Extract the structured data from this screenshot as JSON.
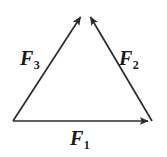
{
  "figure": {
    "name": "force-triangle-diagram",
    "background_color": "#ffffff",
    "stroke_color": "#2b2b2b",
    "stroke_width": 1.6
  },
  "vectors": [
    {
      "id": "f1",
      "label_base": "F",
      "label_sub": "1",
      "direction": "right",
      "from": [
        13,
        121
      ],
      "to": [
        152,
        121
      ],
      "arrowhead_at": "to"
    },
    {
      "id": "f2",
      "label_base": "F",
      "label_sub": "2",
      "direction": "up-left",
      "from": [
        152,
        121
      ],
      "to": [
        89,
        14
      ],
      "arrowhead_at": "to"
    },
    {
      "id": "f3",
      "label_base": "F",
      "label_sub": "3",
      "direction": "up-right",
      "from": [
        13,
        121
      ],
      "to": [
        82,
        14
      ],
      "arrowhead_at": "to"
    }
  ],
  "labels": {
    "f1": {
      "base": "F",
      "sub": "1"
    },
    "f2": {
      "base": "F",
      "sub": "2"
    },
    "f3": {
      "base": "F",
      "sub": "3"
    }
  }
}
